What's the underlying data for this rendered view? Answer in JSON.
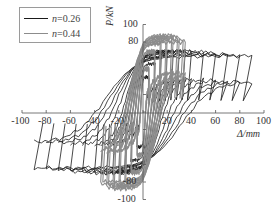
{
  "chart_data": {
    "type": "line",
    "title": "",
    "xlabel": "Δ/mm",
    "ylabel": "P/kN",
    "xlim": [
      -100,
      100
    ],
    "ylim": [
      -100,
      100
    ],
    "x_ticks": [
      -100,
      -80,
      -60,
      -40,
      -20,
      0,
      20,
      40,
      60,
      80,
      100
    ],
    "y_ticks": [
      -100,
      -80,
      80,
      100
    ],
    "grid": false,
    "legend_position": "upper-left",
    "series": [
      {
        "name": "n=0.26",
        "color": "#1a1a1a",
        "description": "Hysteresis loops, cyclic lateral load; peak displacement amplitudes",
        "loop_amplitudes_mm": [
          5,
          10,
          15,
          20,
          25,
          30,
          35,
          40,
          50,
          60,
          70,
          80,
          90
        ],
        "positive_peak_loads_kN": [
          40,
          55,
          62,
          66,
          68,
          69,
          70,
          70,
          69,
          68,
          66,
          65,
          64
        ],
        "negative_peak_loads_kN": [
          -40,
          -55,
          -62,
          -66,
          -68,
          -69,
          -70,
          -70,
          -69,
          -68,
          -66,
          -65,
          -64
        ],
        "max_displacement_mm": [
          90,
          -95
        ]
      },
      {
        "name": "n=0.44",
        "color": "#8c8c8c",
        "description": "Hysteresis loops, cyclic lateral load; peak displacement amplitudes",
        "loop_amplitudes_mm": [
          5,
          10,
          15,
          20,
          25,
          30,
          35
        ],
        "positive_peak_loads_kN": [
          50,
          70,
          80,
          86,
          88,
          86,
          82
        ],
        "negative_peak_loads_kN": [
          -50,
          -70,
          -80,
          -86,
          -88,
          -86,
          -82
        ],
        "max_displacement_mm": [
          35,
          -35
        ]
      }
    ]
  },
  "legend": {
    "items": [
      {
        "label_var": "n",
        "label_val": "=0.26",
        "color": "#1a1a1a"
      },
      {
        "label_var": "n",
        "label_val": "=0.44",
        "color": "#8c8c8c"
      }
    ]
  },
  "axes": {
    "x_tick_labels": [
      "-100",
      "-80",
      "-60",
      "-40",
      "-20",
      "20",
      "40",
      "60",
      "80",
      "100"
    ],
    "y_tick_labels": [
      "100",
      "80",
      "-80",
      "-100"
    ],
    "xlabel": "Δ/mm",
    "ylabel": "P/kN"
  }
}
